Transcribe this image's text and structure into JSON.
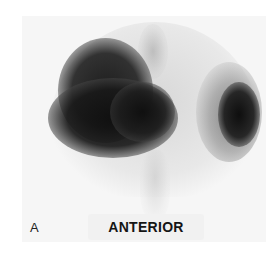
{
  "image": {
    "type": "nuclear-medicine-scan",
    "panel_label": "A",
    "view_label": "ANTERIOR"
  }
}
